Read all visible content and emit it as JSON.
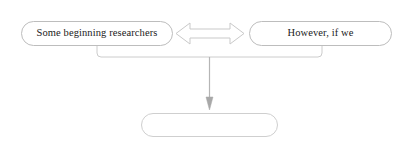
{
  "diagram": {
    "type": "flowchart",
    "background_color": "#ffffff",
    "stroke_color": "#b8b8b8",
    "text_color": "#1a1a1a",
    "nodes": [
      {
        "id": "left-node",
        "name": "some-beginning-researchers-node",
        "shape": "rounded-rectangle",
        "label": "Some beginning researchers",
        "x": 21,
        "y": 21,
        "width": 152,
        "height": 25
      },
      {
        "id": "right-node",
        "name": "however-if-we-node",
        "shape": "rounded-rectangle",
        "label": "However, if we",
        "x": 249,
        "y": 21,
        "width": 143,
        "height": 25
      },
      {
        "id": "bottom-node",
        "name": "empty-result-node",
        "shape": "rounded-rectangle",
        "label": "",
        "x": 141,
        "y": 113,
        "width": 137,
        "height": 24
      }
    ],
    "connectors": [
      {
        "id": "double-arrow",
        "name": "double-headed-arrow",
        "style": "hollow-outline",
        "direction": "bidirectional",
        "from": "left-node",
        "to": "right-node",
        "label": ""
      },
      {
        "id": "merge-bracket",
        "name": "merge-bracket-connector",
        "style": "line",
        "direction": "merge",
        "from": "left-node,right-node",
        "to": "junction",
        "label": ""
      },
      {
        "id": "down-arrow",
        "name": "downward-arrow",
        "style": "solid-head",
        "direction": "down",
        "from": "junction",
        "to": "bottom-node",
        "label": ""
      }
    ]
  }
}
